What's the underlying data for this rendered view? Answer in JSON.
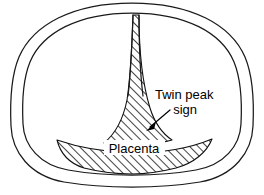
{
  "figure": {
    "type": "anatomical-line-diagram",
    "background_color": "#ffffff",
    "stroke_color": "#1a1a1a"
  },
  "labels": {
    "twin_peak_line1": "Twin peak",
    "twin_peak_line2": "sign",
    "placenta": "Placenta"
  },
  "structures": {
    "uterine_wall": "uterine-wall-outline",
    "gestational_sac": "gestational-sac-outline",
    "dividing_membrane": "dividing-membrane",
    "placental_mass": "placenta-hatched-region",
    "lambda_wedge": "twin-peak-lambda-wedge"
  },
  "annotation": {
    "pointer": "arrow-pointing-to-lambda-wedge"
  }
}
